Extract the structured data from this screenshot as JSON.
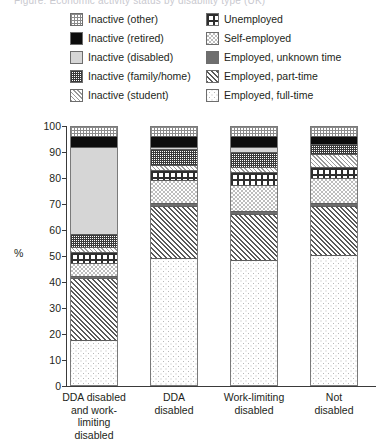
{
  "top_clipped_text": "Figure: Economic activity status by disability type (UK)",
  "axis": {
    "y_title": "%",
    "y_ticks": [
      "100",
      "90",
      "80",
      "70",
      "60",
      "50",
      "40",
      "30",
      "20",
      "10",
      "0"
    ]
  },
  "legend": {
    "left_column": [
      {
        "label": "Inactive (other)",
        "pattern": "p-inactive-other",
        "icon": "fine-grid-swatch"
      },
      {
        "label": "Inactive (retired)",
        "pattern": "p-inactive-retired",
        "icon": "solid-black-swatch"
      },
      {
        "label": "Inactive (disabled)",
        "pattern": "p-inactive-disabled",
        "icon": "solid-light-grey-swatch"
      },
      {
        "label": "Inactive (family/home)",
        "pattern": "p-inactive-family",
        "icon": "dense-grid-swatch"
      },
      {
        "label": "Inactive (student)",
        "pattern": "p-inactive-student",
        "icon": "diagonal-hatch-swatch"
      }
    ],
    "right_column": [
      {
        "label": "Unemployed",
        "pattern": "p-unemployed",
        "icon": "coarse-grid-swatch"
      },
      {
        "label": "Self-employed",
        "pattern": "p-self-employed",
        "icon": "checkerboard-swatch"
      },
      {
        "label": "Employed, unknown time",
        "pattern": "p-employed-unknown",
        "icon": "solid-grey-swatch"
      },
      {
        "label": "Employed, part-time",
        "pattern": "p-employed-part",
        "icon": "dense-diagonal-hatch-swatch"
      },
      {
        "label": "Employed, full-time",
        "pattern": "p-employed-full",
        "icon": "sparse-dot-swatch"
      }
    ]
  },
  "chart_data": {
    "type": "bar",
    "subtype": "stacked-percentage",
    "title": "",
    "xlabel": "",
    "ylabel": "%",
    "ylim": [
      0,
      100
    ],
    "grid": false,
    "legend_position": "top",
    "categories": [
      "DDA disabled and work-limiting disabled",
      "DDA disabled",
      "Work-limiting disabled",
      "Not disabled"
    ],
    "category_label_lines": [
      [
        "DDA disabled",
        "and work-",
        "limiting",
        "disabled"
      ],
      [
        "DDA",
        "disabled"
      ],
      [
        "Work-limiting",
        "disabled"
      ],
      [
        "Not",
        "disabled"
      ]
    ],
    "series": [
      {
        "name": "Inactive (other)",
        "pattern": "p-inactive-other",
        "values": [
          4,
          4,
          4,
          4
        ]
      },
      {
        "name": "Inactive (retired)",
        "pattern": "p-inactive-retired",
        "values": [
          4,
          4,
          4,
          3
        ]
      },
      {
        "name": "Inactive (disabled)",
        "pattern": "p-inactive-disabled",
        "values": [
          34,
          1,
          2,
          0
        ]
      },
      {
        "name": "Inactive (family/home)",
        "pattern": "p-inactive-family",
        "values": [
          5,
          6,
          6,
          4
        ]
      },
      {
        "name": "Inactive (student)",
        "pattern": "p-inactive-student",
        "values": [
          2,
          2,
          2,
          5
        ]
      },
      {
        "name": "Unemployed",
        "pattern": "p-unemployed",
        "values": [
          4,
          4,
          5,
          4
        ]
      },
      {
        "name": "Self-employed",
        "pattern": "p-self-employed",
        "values": [
          5,
          9,
          10,
          10
        ]
      },
      {
        "name": "Employed, unknown time",
        "pattern": "p-employed-unknown",
        "values": [
          1,
          1,
          1,
          1
        ]
      },
      {
        "name": "Employed, part-time",
        "pattern": "p-employed-part",
        "values": [
          24,
          20,
          18,
          19
        ]
      },
      {
        "name": "Employed, full-time",
        "pattern": "p-employed-full",
        "values": [
          17,
          49,
          48,
          50
        ]
      }
    ]
  }
}
